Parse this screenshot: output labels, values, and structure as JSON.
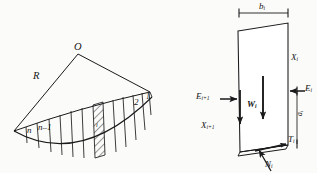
{
  "figure": {
    "ink_color": "#1a1a1a",
    "background": "#fbfbfa"
  },
  "left_diagram": {
    "name": "circular-slip-surface-with-slices",
    "center_label": "O",
    "radius_label": "R",
    "slice_labels": {
      "last": "n",
      "second_last_base": "n",
      "second_last_suffix": "–1",
      "hatched": "i",
      "second": "2",
      "first": "1"
    },
    "slice_count_visible": 12
  },
  "right_diagram": {
    "name": "free-body-diagram-of-slice-i",
    "width_dimension": {
      "base": "b",
      "sub": "i"
    },
    "height_dimension": {
      "base": "a",
      "sub": "i"
    },
    "forces": [
      {
        "symbol": "W",
        "sub": "i",
        "name": "weight-force",
        "direction": "down"
      },
      {
        "symbol": "E",
        "sub": "i",
        "name": "interslice-normal-right",
        "direction": "left"
      },
      {
        "symbol": "X",
        "sub": "i",
        "name": "interslice-shear-right",
        "direction": "none"
      },
      {
        "symbol": "E",
        "sub": "i+1",
        "name": "interslice-normal-left",
        "direction": "right"
      },
      {
        "symbol": "X",
        "sub": "i+1",
        "name": "interslice-shear-left",
        "direction": "down"
      },
      {
        "symbol": "T",
        "sub": "i",
        "name": "base-shear-force",
        "direction": "up-right"
      },
      {
        "symbol": "N",
        "sub": "i",
        "name": "base-normal-force",
        "direction": "up-left"
      }
    ]
  }
}
